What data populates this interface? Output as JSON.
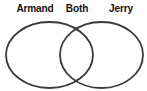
{
  "diagram": {
    "type": "venn",
    "left_label": "Armand",
    "intersection_label": "Both",
    "right_label": "Jerry",
    "stroke_color": "#3a3a3a",
    "text_color": "#111111",
    "background_color": "#ffffff"
  }
}
